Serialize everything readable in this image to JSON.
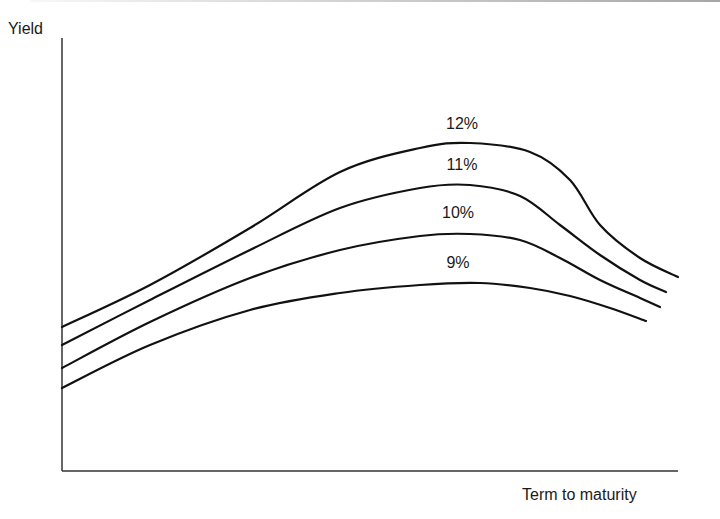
{
  "chart_data": {
    "type": "line",
    "title": "",
    "xlabel": "Term to maturity",
    "ylabel": "Yield",
    "grid": false,
    "legend": "inline labels above each curve",
    "x_ticks": [],
    "y_ticks": [],
    "series": [
      {
        "name": "12%",
        "label_pos": [
          462,
          127
        ],
        "points": [
          [
            62,
            327
          ],
          [
            150,
            285
          ],
          [
            250,
            228
          ],
          [
            340,
            172
          ],
          [
            420,
            148
          ],
          [
            470,
            143
          ],
          [
            530,
            152
          ],
          [
            570,
            180
          ],
          [
            600,
            225
          ],
          [
            640,
            258
          ],
          [
            678,
            277
          ]
        ]
      },
      {
        "name": "11%",
        "label_pos": [
          462,
          168
        ],
        "points": [
          [
            62,
            345
          ],
          [
            150,
            300
          ],
          [
            250,
            250
          ],
          [
            340,
            208
          ],
          [
            420,
            188
          ],
          [
            470,
            185
          ],
          [
            520,
            196
          ],
          [
            560,
            225
          ],
          [
            600,
            255
          ],
          [
            640,
            280
          ],
          [
            666,
            292
          ]
        ]
      },
      {
        "name": "10%",
        "label_pos": [
          458,
          216
        ],
        "points": [
          [
            62,
            368
          ],
          [
            150,
            322
          ],
          [
            250,
            278
          ],
          [
            340,
            250
          ],
          [
            420,
            236
          ],
          [
            470,
            234
          ],
          [
            520,
            240
          ],
          [
            560,
            258
          ],
          [
            600,
            280
          ],
          [
            640,
            298
          ],
          [
            660,
            307
          ]
        ]
      },
      {
        "name": "9%",
        "label_pos": [
          458,
          266
        ],
        "points": [
          [
            62,
            388
          ],
          [
            150,
            345
          ],
          [
            250,
            310
          ],
          [
            340,
            293
          ],
          [
            420,
            285
          ],
          [
            480,
            283
          ],
          [
            530,
            288
          ],
          [
            570,
            296
          ],
          [
            610,
            308
          ],
          [
            646,
            321
          ]
        ]
      }
    ]
  },
  "labels": {
    "y_axis": "Yield",
    "x_axis": "Term to maturity"
  },
  "colors": {
    "line": "#111111",
    "axis": "#333333",
    "background": "#ffffff"
  }
}
